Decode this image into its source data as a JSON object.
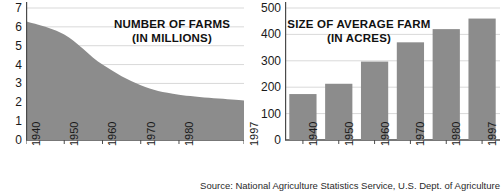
{
  "source_note": "Source: National Agriculture Statistics Service, U.S. Dept. of Agriculture",
  "colors": {
    "fill": "#8c8c8c",
    "gridline": "#d9d9d9",
    "axis": "#4a4a4a",
    "text": "#1a1a1a",
    "background": "#ffffff"
  },
  "charts": {
    "left": {
      "title_line1": "NUMBER OF FARMS",
      "title_line2": "(IN MILLIONS)",
      "ytick_labels": [
        "7",
        "6",
        "5",
        "4",
        "3",
        "2",
        "1",
        "0"
      ],
      "xtick_labels": [
        "1940",
        "1950",
        "1960",
        "1970",
        "1980",
        "1997"
      ]
    },
    "right": {
      "title_line1": "SIZE OF AVERAGE FARM",
      "title_line2": "(IN ACRES)",
      "ytick_labels": [
        "500",
        "400",
        "300",
        "200",
        "100",
        "0"
      ],
      "xtick_labels": [
        "1940",
        "1950",
        "1960",
        "1970",
        "1980",
        "1997"
      ]
    }
  },
  "chart_data": [
    {
      "type": "area",
      "title": "NUMBER OF FARMS (IN MILLIONS)",
      "xlabel": "",
      "ylabel": "",
      "x": [
        1940,
        1950,
        1960,
        1970,
        1980,
        1997
      ],
      "categories": [
        "1940",
        "1950",
        "1960",
        "1970",
        "1980",
        "1997"
      ],
      "values": [
        6.3,
        5.6,
        4.0,
        2.9,
        2.4,
        2.1
      ],
      "units": "millions of farms",
      "ylim": [
        0,
        7
      ],
      "yticks": [
        0,
        1,
        2,
        3,
        4,
        5,
        6,
        7
      ],
      "xlim": [
        1940,
        1997
      ],
      "grid": true,
      "grid_axis": "y",
      "legend": false,
      "fill_color": "#8c8c8c"
    },
    {
      "type": "bar",
      "title": "SIZE OF AVERAGE FARM (IN ACRES)",
      "xlabel": "",
      "ylabel": "",
      "categories": [
        "1940",
        "1950",
        "1960",
        "1970",
        "1980",
        "1997"
      ],
      "values": [
        174,
        213,
        297,
        370,
        420,
        460
      ],
      "units": "acres",
      "ylim": [
        0,
        500
      ],
      "yticks": [
        0,
        100,
        200,
        300,
        400,
        500
      ],
      "grid": true,
      "grid_axis": "y",
      "legend": false,
      "bar_color": "#8c8c8c"
    }
  ]
}
